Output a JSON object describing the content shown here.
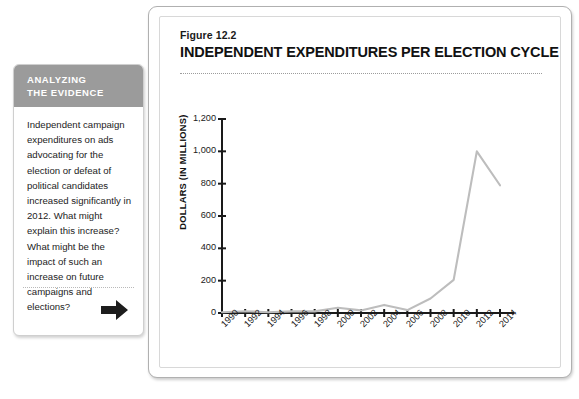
{
  "sidebar": {
    "header_line1": "ANALYZING",
    "header_line2": "THE EVIDENCE",
    "body_text": "Independent campaign expenditures on ads advocating for the election or defeat of political candidates increased significantly in 2012. What might explain this increase? What might be the impact of such an increase on future campaigns and elections?",
    "arrow_icon": "arrow-right-icon",
    "header_bg": "#9b9b9b"
  },
  "figure": {
    "number_label": "Figure 12.2",
    "title": "INDEPENDENT EXPENDITURES PER ELECTION CYCLE"
  },
  "chart_data": {
    "type": "line",
    "title": "INDEPENDENT EXPENDITURES PER ELECTION CYCLE",
    "xlabel": "",
    "ylabel": "DOLLARS (IN MILLIONS)",
    "categories": [
      "1990",
      "1992",
      "1994",
      "1996",
      "1998",
      "2000",
      "2002",
      "2004",
      "2006",
      "2008",
      "2010",
      "2012",
      "2014"
    ],
    "values": [
      5,
      11,
      5,
      10,
      10,
      32,
      16,
      50,
      18,
      90,
      205,
      1000,
      790
    ],
    "ytick_labels": [
      "0",
      "200",
      "400",
      "600",
      "800",
      "1,000",
      "1,200"
    ],
    "ytick_values": [
      0,
      200,
      400,
      600,
      800,
      1000,
      1200
    ],
    "ylim": [
      0,
      1200
    ],
    "grid": false,
    "legend": "none",
    "line_color": "#bdbdbd",
    "axis_color": "#1a1a1a"
  }
}
